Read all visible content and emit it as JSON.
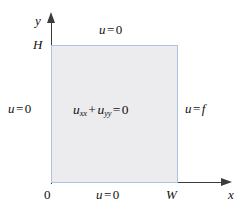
{
  "figure": {
    "type": "boundary-value-problem-diagram",
    "background_color": "#ffffff"
  },
  "axes": {
    "x_label": "x",
    "y_label": "y",
    "color": "#3c3c3c",
    "origin_label": "0"
  },
  "domain": {
    "fill_color": "#ecebee",
    "border_color": "#a9c5e3",
    "width_label": "W",
    "height_label": "H"
  },
  "equation": {
    "u": "u",
    "sub_xx": "xx",
    "plus": "+",
    "sub_yy": "yy",
    "equals": "=",
    "rhs": "0"
  },
  "boundary_conditions": {
    "top": {
      "lhs": "u",
      "op": "=",
      "rhs": "0"
    },
    "left": {
      "lhs": "u",
      "op": "=",
      "rhs": "0"
    },
    "right": {
      "lhs": "u",
      "op": "=",
      "rhs": "f"
    },
    "bottom": {
      "lhs": "u",
      "op": "=",
      "rhs": "0"
    }
  }
}
